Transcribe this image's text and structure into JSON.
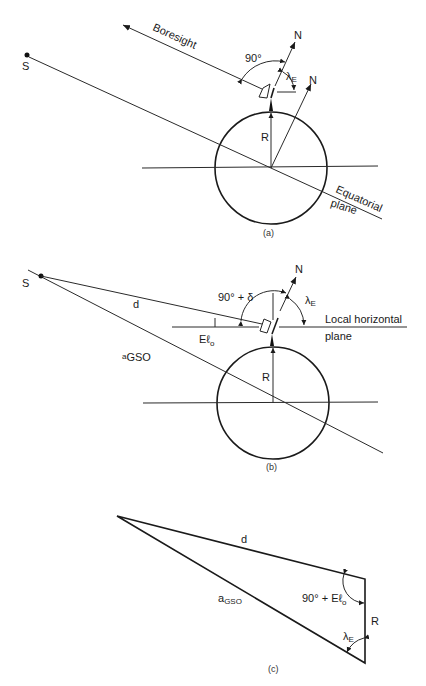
{
  "panel_a": {
    "caption": "(a)",
    "satellite_label": "S",
    "boresight_label": "Boresight",
    "angle_90_label": "90°",
    "north_label_1": "N",
    "north_label_2": "N",
    "lambda_label": "λ",
    "lambda_sub": "E",
    "radius_label": "R",
    "equatorial_label_1": "Equatorial",
    "equatorial_label_2": "plane"
  },
  "panel_b": {
    "caption": "(b)",
    "satellite_label": "S",
    "distance_label": "d",
    "angle_label": "90° + δ",
    "north_label": "N",
    "lambda_label": "λ",
    "lambda_sub": "E",
    "elevation_label": "Eℓ",
    "elevation_sub": "o",
    "horizontal_label_1": "Local horizontal",
    "horizontal_label_2": "plane",
    "agso_label": "a",
    "agso_sub": "GSO",
    "radius_label": "R"
  },
  "panel_c": {
    "caption": "(c)",
    "distance_label": "d",
    "agso_label": "a",
    "agso_sub": "GSO",
    "angle_label": "90° + Eℓ",
    "angle_sub": "o",
    "radius_label": "R",
    "lambda_label": "λ",
    "lambda_sub": "E"
  }
}
